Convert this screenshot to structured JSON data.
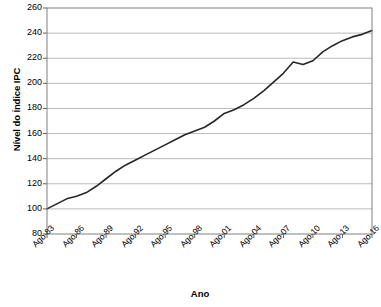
{
  "chart_data": {
    "type": "line",
    "title": "",
    "xlabel": "Ano",
    "ylabel": "Nível do Índice IPC",
    "ylim": [
      80,
      260
    ],
    "ytick_step": 20,
    "yticks": [
      260,
      240,
      220,
      200,
      180,
      160,
      140,
      120,
      100,
      80
    ],
    "xticks": [
      "Ago-83",
      "Ago-86",
      "Ago-89",
      "Ago-92",
      "Ago-95",
      "Ago-98",
      "Ago-01",
      "Ago-04",
      "Ago-07",
      "Ago-10",
      "Ago-13",
      "Ago-16"
    ],
    "grid": true,
    "grid_color": "#b3b3b3",
    "legend": "none",
    "line_color": "#262626",
    "line_width": 1.6,
    "series": [
      {
        "name": "Nível do Índice IPC",
        "x": [
          "Ago-83",
          "Ago-84",
          "Ago-85",
          "Ago-86",
          "Ago-87",
          "Ago-88",
          "Ago-89",
          "Ago-90",
          "Ago-91",
          "Ago-92",
          "Ago-93",
          "Ago-94",
          "Ago-95",
          "Ago-96",
          "Ago-97",
          "Ago-98",
          "Ago-99",
          "Ago-00",
          "Ago-01",
          "Ago-02",
          "Ago-03",
          "Ago-04",
          "Ago-05",
          "Ago-06",
          "Ago-07",
          "Ago-08",
          "Ago-09",
          "Ago-10",
          "Ago-11",
          "Ago-12",
          "Ago-13",
          "Ago-14",
          "Ago-15",
          "Ago-16"
        ],
        "values": [
          100,
          104,
          108,
          110,
          113,
          118,
          124,
          130,
          135,
          139,
          143,
          147,
          151,
          155,
          159,
          162,
          165,
          170,
          176,
          179,
          183,
          188,
          194,
          201,
          208,
          217,
          215,
          218,
          225,
          230,
          234,
          237,
          239,
          242
        ]
      }
    ]
  },
  "axes": {
    "y_title": "Nível do Índice IPC",
    "x_title": "Ano"
  }
}
